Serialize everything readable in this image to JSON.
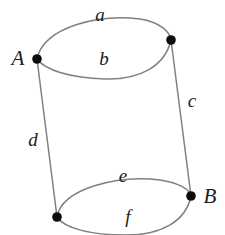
{
  "figure": {
    "width": 225,
    "height": 235,
    "background_color": "#ffffff",
    "curve_color": "#808080",
    "vertex_color": "#0d0d0d",
    "label_color": "#1a1a1a",
    "stroke_width": 1.5,
    "vertex_radius": 4.8
  },
  "vertices": [
    {
      "id": "A",
      "label": "A",
      "x": 37,
      "y": 59,
      "label_x": 18,
      "label_y": 58
    },
    {
      "id": "TR",
      "label": "",
      "x": 171,
      "y": 40,
      "label_x": 0,
      "label_y": 0
    },
    {
      "id": "B",
      "label": "B",
      "x": 191,
      "y": 196,
      "label_x": 210,
      "label_y": 196
    },
    {
      "id": "BL",
      "label": "",
      "x": 57,
      "y": 217,
      "label_x": 0,
      "label_y": 0
    }
  ],
  "edges": [
    {
      "id": "a",
      "label": "a",
      "kind": "arc",
      "from": "A",
      "to": "TR",
      "side": "upper",
      "label_x": 100,
      "label_y": 14
    },
    {
      "id": "b",
      "label": "b",
      "kind": "arc",
      "from": "A",
      "to": "TR",
      "side": "lower",
      "label_x": 104,
      "label_y": 58
    },
    {
      "id": "c",
      "label": "c",
      "kind": "line",
      "from": "TR",
      "to": "B",
      "side": "right",
      "label_x": 192,
      "label_y": 100
    },
    {
      "id": "d",
      "label": "d",
      "kind": "line",
      "from": "A",
      "to": "BL",
      "side": "left",
      "label_x": 33,
      "label_y": 139
    },
    {
      "id": "e",
      "label": "e",
      "kind": "arc",
      "from": "BL",
      "to": "B",
      "side": "upper",
      "label_x": 123,
      "label_y": 175
    },
    {
      "id": "f",
      "label": "f",
      "kind": "arc",
      "from": "BL",
      "to": "B",
      "side": "lower",
      "label_x": 128,
      "label_y": 216
    }
  ],
  "paths": {
    "arc_a": "M 37 59 C 44 26, 100 14, 140 19 C 160 22, 170 32, 171 40",
    "arc_b": "M 37 59 C 45 70, 70 78, 105 79 C 140 80, 165 66, 171 40",
    "line_c": "M 171 40 L 191 196",
    "line_d": "M 37 59 L 57 217",
    "arc_e": "M 57 217 C 62 188, 118 175, 160 180 C 180 183, 190 190, 191 196",
    "arc_f": "M 57 217 C 64 228, 90 235, 126 235 C 162 235, 186 221, 191 196"
  }
}
